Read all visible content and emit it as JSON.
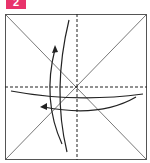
{
  "step": {
    "number": "2",
    "color": "#e8336b"
  },
  "diagram": {
    "type": "origami-fold-step",
    "paper": {
      "x": 5,
      "y": 14,
      "size": 142,
      "border_color": "#555555"
    },
    "diagonals": true,
    "center_folds": {
      "style": "dashed",
      "vertical": true,
      "horizontal": true
    },
    "arrows": [
      {
        "name": "fold-up-arrow",
        "direction": "up-left"
      },
      {
        "name": "fold-left-arrow",
        "direction": "left"
      }
    ]
  }
}
